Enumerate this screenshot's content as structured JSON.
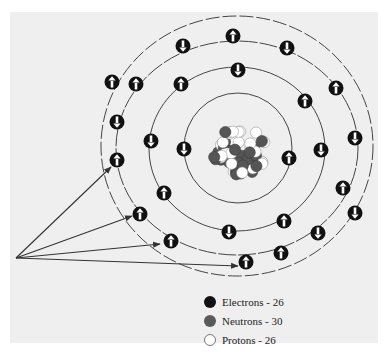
{
  "diagram": {
    "colors": {
      "background": "#efefef",
      "electron": "#111111",
      "neutron": "#555555",
      "proton": "#ffffff",
      "ring": "#444444",
      "arrow": "#333333"
    },
    "nucleus": {
      "cx": 239,
      "cy": 151
    },
    "rings": [
      {
        "cx": 238,
        "cy": 148,
        "rx": 54,
        "ry": 55
      },
      {
        "cx": 237,
        "cy": 149,
        "rx": 88,
        "ry": 82
      },
      {
        "cx": 237,
        "cy": 148,
        "rx": 121,
        "ry": 107
      },
      {
        "cx": 237,
        "cy": 146,
        "rx": 136,
        "ry": 130
      }
    ],
    "electrons": [
      {
        "x": 184,
        "y": 149,
        "spin": "down",
        "ring": 1
      },
      {
        "x": 289,
        "y": 158,
        "spin": "up",
        "ring": 1
      },
      {
        "x": 238,
        "y": 70,
        "spin": "down",
        "ring": 2
      },
      {
        "x": 181,
        "y": 84,
        "spin": "up",
        "ring": 2
      },
      {
        "x": 305,
        "y": 101,
        "spin": "up",
        "ring": 2
      },
      {
        "x": 151,
        "y": 141,
        "spin": "down",
        "ring": 2
      },
      {
        "x": 321,
        "y": 150,
        "spin": "down",
        "ring": 2
      },
      {
        "x": 164,
        "y": 193,
        "spin": "up",
        "ring": 2
      },
      {
        "x": 284,
        "y": 221,
        "spin": "up",
        "ring": 2
      },
      {
        "x": 229,
        "y": 232,
        "spin": "down",
        "ring": 2
      },
      {
        "x": 183,
        "y": 46,
        "spin": "down",
        "ring": 3
      },
      {
        "x": 287,
        "y": 48,
        "spin": "down",
        "ring": 3
      },
      {
        "x": 136,
        "y": 84,
        "spin": "up",
        "ring": 3
      },
      {
        "x": 336,
        "y": 88,
        "spin": "up",
        "ring": 3
      },
      {
        "x": 117,
        "y": 122,
        "spin": "down",
        "ring": 3
      },
      {
        "x": 355,
        "y": 138,
        "spin": "down",
        "ring": 3
      },
      {
        "x": 117,
        "y": 160,
        "spin": "up",
        "ring": 3
      },
      {
        "x": 343,
        "y": 188,
        "spin": "up",
        "ring": 3
      },
      {
        "x": 140,
        "y": 214,
        "spin": "up",
        "ring": 3
      },
      {
        "x": 318,
        "y": 233,
        "spin": "down",
        "ring": 3
      },
      {
        "x": 171,
        "y": 241,
        "spin": "up",
        "ring": 3
      },
      {
        "x": 281,
        "y": 253,
        "spin": "up",
        "ring": 3
      },
      {
        "x": 233,
        "y": 36,
        "spin": "up",
        "ring": 4
      },
      {
        "x": 112,
        "y": 82,
        "spin": "up",
        "ring": 4
      },
      {
        "x": 355,
        "y": 213,
        "spin": "down",
        "ring": 4
      },
      {
        "x": 246,
        "y": 262,
        "spin": "up",
        "ring": 4
      }
    ],
    "pointer_arrows": {
      "origin": {
        "x": 16,
        "y": 258
      },
      "targets": [
        {
          "x": 111,
          "y": 167
        },
        {
          "x": 132,
          "y": 216
        },
        {
          "x": 160,
          "y": 244
        },
        {
          "x": 238,
          "y": 266
        }
      ]
    }
  },
  "legend": {
    "items": [
      {
        "label": "Electrons - 26",
        "type": "electron"
      },
      {
        "label": "Neutrons - 30",
        "type": "neutron"
      },
      {
        "label": "Protons - 26",
        "type": "proton"
      }
    ]
  }
}
